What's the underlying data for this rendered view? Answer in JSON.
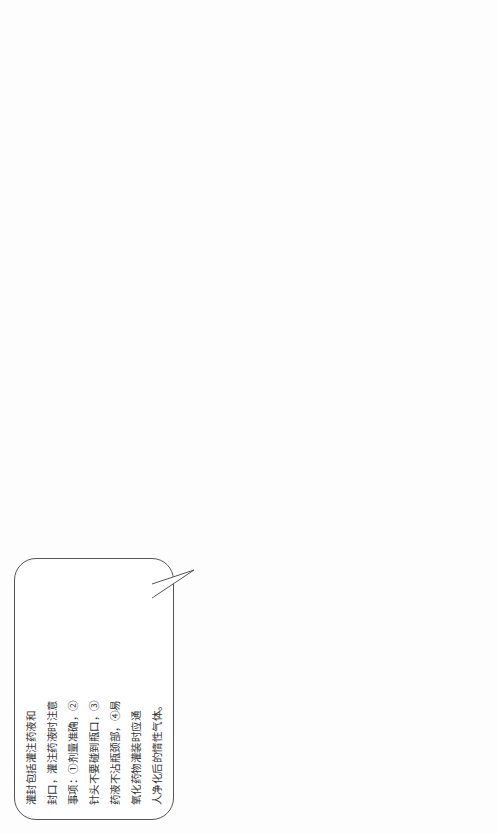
{
  "figure": {
    "caption_number": "图 33-1",
    "caption_title": "小容量注射剂的生产工艺流程及解析图"
  },
  "flow": {
    "steps": [
      "灌注、熔封",
      "灭菌 、检漏",
      "印字、包装",
      "成 品",
      "质量检查"
    ],
    "sub_steps": {
      "drying": "干燥与灭菌",
      "washing": "洗涤",
      "ampoule": "安瓿"
    }
  },
  "callouts": {
    "filling": {
      "lines": [
        "灌封包括灌注药液和",
        "封口，灌注药液时注意",
        "事项：①剂量准确，②",
        "针头不要碰到瓶口，③",
        "药液不沾瓶颈部，④易",
        "氧化药物灌装时应通",
        "人净化后的惰性气体。"
      ]
    },
    "sterilization": {
      "lines": [
        "灭菌一般常用 100 ℃",
        "30min 湿热灭菌，",
        "10～20 mL 的安瓿灭",
        "菌时间可延长至",
        "45 min 。",
        "检漏是检查出未完",
        "全封闭的安瓿。"
      ]
    },
    "printing": {
      "lines": [
        "注射剂经质量检查",
        "合格后即可印字、包",
        "装，每支注射剂应直",
        "接印上品名、规格、",
        "批号等。",
        "包装盒应有防破碎",
        "措施。"
      ]
    },
    "quality_items": {
      "lines": [
        "1. 可见异物",
        "2. 不溶性微粒",
        "3. 有关物质",
        "4. 无菌",
        "5. 热原或细菌内毒素",
        "6. 装量差异限度"
      ]
    },
    "other_tests": {
      "lines": [
        "其他如鉴别试验、含量",
        "测定、杂质检查、溶血",
        "检查、安全试验等根据",
        "品种要求，上述各项均",
        "应符合药典要求。"
      ]
    },
    "cleanup": {
      "lines": [
        "操作完毕应",
        "按 GMP 要",
        "求进行清场"
      ]
    },
    "drying": {
      "lines": [
        "烘箱：干燥为120~140℃，",
        "2h；灭菌为 200 ℃以上，",
        "超过 45min 。隧道式烘",
        "干机或隧道式灭菌机，",
        "安瓿干燥或灭菌后应",
        "及时使用。"
      ]
    },
    "washing": {
      "lines": [
        "先将安瓿灌满纯化水，100 ℃蒸煮 30min 再进行洗涤，目的",
        "是使瓶内灰尘和附着的砂粒等杂质经加热浸泡后落入水",
        "中，易于洗涤干净，并能使玻璃表面的硅酸盐水解，微量",
        "的游离碱和金属离子溶解，提高安瓿的化学稳定性。",
        "洗涤方法有以下几种。",
        "1. 用水洗涤法  一般仅限于 5mL 以下的安瓿洗涤。",
        "2. 气水喷射洗涤法  是用滤过的纯化水与滤过的压缩空气，",
        "由针头喷入瓶内交替喷射洗涤，通常交替洗涤 4～8 次。",
        "3. 超声波洗涤法  先超声波粗洗，再经气水交替洗涤。"
      ]
    },
    "ampoule_spec": {
      "lines": [
        "规格有 1mL 、2mL 、5mL 、10mL 、20mL",
        "等，按国家规定，水针剂使用的安瓿一",
        "律为曲颈易折安瓿，其标准应符合国家",
        "标准 GB 2637—1995 。",
        "质量要求：①无色透明，洁净无附着物，",
        "②膨胀系数小、耐热性好，③有足够机",
        "械强度和抗冲击强度，④化学性质稳",
        "定，遇药液不析出 、不腐蚀，⑤熔点较",
        "低，易于熔封，⑥不得有气泡、麻点和",
        "砂粒。"
      ]
    }
  }
}
